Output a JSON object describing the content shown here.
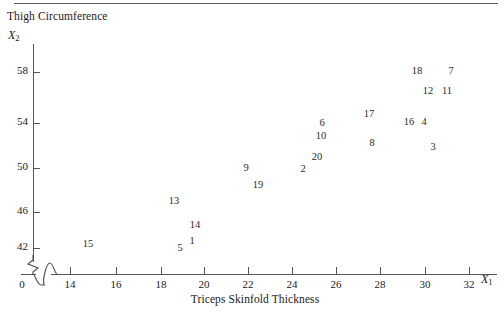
{
  "figure": {
    "title": "Thigh Circumference",
    "x_axis_title": "Triceps Skinfold Thickness",
    "x_var": "X",
    "x_var_sub": "1",
    "y_var": "X",
    "y_var_sub": "2",
    "origin_label": "0"
  },
  "chart_data": {
    "type": "scatter",
    "title": "Thigh Circumference",
    "xlabel": "Triceps Skinfold Thickness",
    "ylabel": "Thigh Circumference",
    "x_axis_symbol": "X1",
    "y_axis_symbol": "X2",
    "xlim": [
      13,
      33
    ],
    "ylim": [
      41,
      60
    ],
    "x_ticks": [
      14,
      16,
      18,
      20,
      22,
      24,
      26,
      28,
      30,
      32
    ],
    "y_ticks": [
      42,
      46,
      50,
      54,
      58
    ],
    "axis_break_x": true,
    "axis_break_y": true,
    "grid": false,
    "legend": false,
    "point_label_mode": "case-number",
    "points": [
      {
        "label": "15",
        "x": 14.6,
        "y": 42.6
      },
      {
        "label": "13",
        "x": 19.1,
        "y": 44.7
      },
      {
        "label": "14",
        "x": 20.0,
        "y": 43.6
      },
      {
        "label": "1",
        "x": 19.9,
        "y": 42.9
      },
      {
        "label": "5",
        "x": 19.4,
        "y": 42.6
      },
      {
        "label": "9",
        "x": 22.0,
        "y": 48.0
      },
      {
        "label": "19",
        "x": 22.3,
        "y": 47.2
      },
      {
        "label": "2",
        "x": 24.5,
        "y": 48.2
      },
      {
        "label": "20",
        "x": 25.0,
        "y": 48.8
      },
      {
        "label": "10",
        "x": 24.9,
        "y": 50.3
      },
      {
        "label": "6",
        "x": 24.9,
        "y": 51.1
      },
      {
        "label": "8",
        "x": 27.3,
        "y": 49.7
      },
      {
        "label": "17",
        "x": 27.4,
        "y": 51.6
      },
      {
        "label": "16",
        "x": 29.7,
        "y": 51.1
      },
      {
        "label": "4",
        "x": 30.2,
        "y": 51.1
      },
      {
        "label": "3",
        "x": 30.5,
        "y": 49.2
      },
      {
        "label": "12",
        "x": 30.0,
        "y": 55.8
      },
      {
        "label": "11",
        "x": 30.7,
        "y": 55.8
      },
      {
        "label": "18",
        "x": 29.4,
        "y": 57.6
      },
      {
        "label": "7",
        "x": 30.9,
        "y": 57.6
      }
    ]
  },
  "rendered_points": [
    {
      "label": "15",
      "px": 88,
      "py": 243
    },
    {
      "label": "13",
      "px": 174,
      "py": 200
    },
    {
      "label": "14",
      "px": 195,
      "py": 224
    },
    {
      "label": "1",
      "px": 192,
      "py": 240
    },
    {
      "label": "5",
      "px": 180,
      "py": 247
    },
    {
      "label": "9",
      "px": 246,
      "py": 167
    },
    {
      "label": "19",
      "px": 258,
      "py": 184
    },
    {
      "label": "2",
      "px": 303,
      "py": 168
    },
    {
      "label": "20",
      "px": 317,
      "py": 156
    },
    {
      "label": "10",
      "px": 321,
      "py": 135
    },
    {
      "label": "6",
      "px": 322,
      "py": 122
    },
    {
      "label": "8",
      "px": 372,
      "py": 142
    },
    {
      "label": "17",
      "px": 369,
      "py": 113
    },
    {
      "label": "16",
      "px": 409,
      "py": 121
    },
    {
      "label": "4",
      "px": 424,
      "py": 121
    },
    {
      "label": "3",
      "px": 433,
      "py": 146
    },
    {
      "label": "12",
      "px": 428,
      "py": 90
    },
    {
      "label": "11",
      "px": 447,
      "py": 90
    },
    {
      "label": "18",
      "px": 417,
      "py": 70
    },
    {
      "label": "7",
      "px": 451,
      "py": 70
    }
  ],
  "y_axis": [
    {
      "value": "58",
      "py": 72
    },
    {
      "value": "54",
      "py": 123
    },
    {
      "value": "50",
      "py": 168
    },
    {
      "value": "46",
      "py": 212
    },
    {
      "value": "42",
      "py": 248
    }
  ],
  "x_axis": [
    {
      "value": "14",
      "px": 70
    },
    {
      "value": "16",
      "px": 116
    },
    {
      "value": "18",
      "px": 161
    },
    {
      "value": "20",
      "px": 204
    },
    {
      "value": "22",
      "px": 248
    },
    {
      "value": "24",
      "px": 292
    },
    {
      "value": "26",
      "px": 336
    },
    {
      "value": "28",
      "px": 380
    },
    {
      "value": "30",
      "px": 425
    },
    {
      "value": "32",
      "px": 469
    }
  ]
}
